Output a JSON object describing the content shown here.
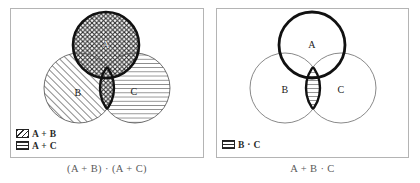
{
  "figure": {
    "background_color": "#ffffff",
    "panel_border_color": "#b4b4b4",
    "ink_color": "#1a1a1a"
  },
  "panels": [
    {
      "id": "left",
      "caption": "(A + B) · (A + C)",
      "circles": [
        {
          "name": "A",
          "label": "A",
          "cx": 106,
          "cy": 45,
          "r": 33,
          "stroke": "thick",
          "fill": "crosshatch"
        },
        {
          "name": "B",
          "label": "B",
          "cx": 79,
          "cy": 88,
          "r": 35,
          "stroke": "thin",
          "fill": "diagonal"
        },
        {
          "name": "C",
          "label": "C",
          "cx": 135,
          "cy": 88,
          "r": 35,
          "stroke": "thin",
          "fill": "horizontal"
        }
      ],
      "highlight_region": {
        "name": "b-intersect-c-lens",
        "fill": "crosshatch",
        "stroke": "thick"
      },
      "legend": [
        {
          "swatch": "diagonal-hatch-swatch",
          "label": "A + B"
        },
        {
          "swatch": "horizontal-line-swatch",
          "label": "A + C"
        }
      ]
    },
    {
      "id": "right",
      "caption": "A + B · C",
      "circles": [
        {
          "name": "A",
          "label": "A",
          "cx": 312,
          "cy": 45,
          "r": 33,
          "stroke": "thick",
          "fill": "none"
        },
        {
          "name": "B",
          "label": "B",
          "cx": 285,
          "cy": 88,
          "r": 35,
          "stroke": "thin",
          "fill": "none"
        },
        {
          "name": "C",
          "label": "C",
          "cx": 341,
          "cy": 88,
          "r": 35,
          "stroke": "thin",
          "fill": "none"
        }
      ],
      "highlight_region": {
        "name": "b-intersect-c-lens",
        "fill": "horizontal",
        "stroke": "thick"
      },
      "legend": [
        {
          "swatch": "horizontal-line-swatch",
          "label": "B · C"
        }
      ]
    }
  ]
}
